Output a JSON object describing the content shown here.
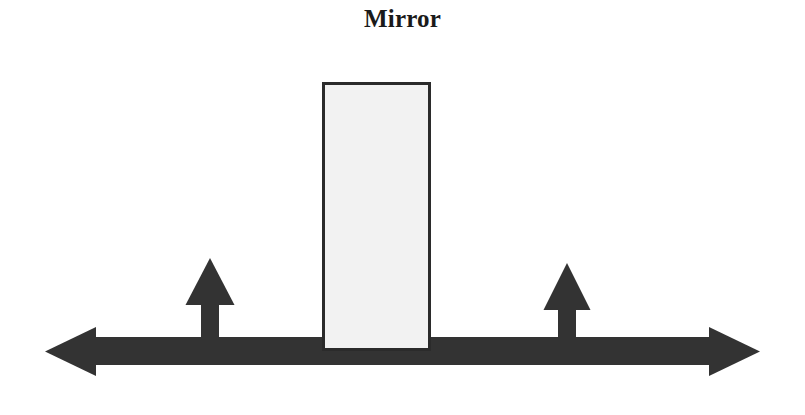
{
  "figure": {
    "title": "Mirror",
    "background_color": "#ffffff",
    "stroke_color": "#333333",
    "mirror_fill_color": "#f2f2f2",
    "mirror_border_color": "#2b2b2b",
    "title_color": "#1a1a1a",
    "elements": {
      "axis_arrow": {
        "label": "horizontal-double-headed-axis-arrow",
        "bar_left_x": 45,
        "bar_right_x": 760,
        "bar_top_y": 337,
        "bar_bottom_y": 365,
        "head_width": 52,
        "head_top_y": 328,
        "head_bottom_y": 376
      },
      "mirror_rect": {
        "label": "mirror-surface",
        "x": 323,
        "y": 83,
        "width": 107,
        "height": 267
      },
      "ray_arrow_left": {
        "label": "incident-ray-arrow",
        "shaft_x": 201,
        "shaft_width": 18,
        "tip_y": 258,
        "head_base_y": 305,
        "head_left_x": 186,
        "head_right_x": 234,
        "base_y": 352
      },
      "ray_arrow_right": {
        "label": "reflected-ray-arrow",
        "shaft_x": 558,
        "shaft_width": 18,
        "tip_y": 263,
        "head_base_y": 310,
        "head_left_x": 544,
        "head_right_x": 590,
        "base_y": 352
      }
    }
  }
}
